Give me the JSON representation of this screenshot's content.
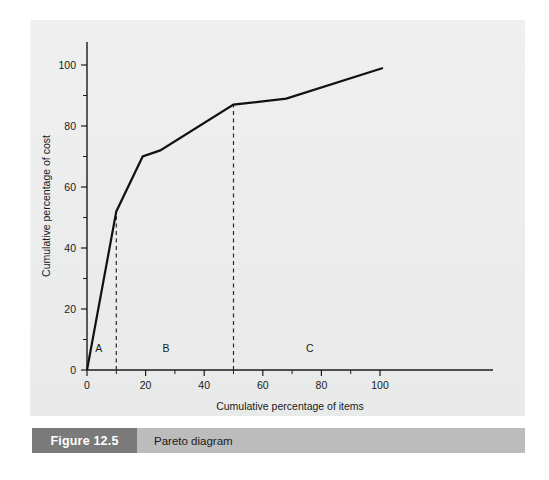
{
  "figure": {
    "number_label": "Figure 12.5",
    "title": "Pareto diagram"
  },
  "chart_data": {
    "type": "line",
    "title": "",
    "xlabel": "Cumulative percentage of items",
    "ylabel": "Cumulative percentage of cost",
    "xlim": [
      0,
      100
    ],
    "ylim": [
      0,
      100
    ],
    "xticks": [
      0,
      20,
      40,
      60,
      80,
      100
    ],
    "yticks": [
      0,
      20,
      40,
      60,
      80,
      100
    ],
    "xtick_labels": [
      "0",
      "20",
      "40",
      "60",
      "80",
      "100"
    ],
    "ytick_labels": [
      "0",
      "20",
      "40",
      "60",
      "80",
      "100"
    ],
    "minor_tick_step": 10,
    "grid": false,
    "legend": null,
    "series": [
      {
        "name": "Cumulative cost curve",
        "x": [
          0,
          10,
          19,
          25,
          50,
          68,
          101
        ],
        "y": [
          0,
          52,
          70,
          72,
          87,
          89,
          99
        ]
      }
    ],
    "annotations": [
      {
        "name": "region-label-a",
        "text": "A",
        "x": 4,
        "y": 6
      },
      {
        "name": "region-label-b",
        "text": "B",
        "x": 27,
        "y": 6
      },
      {
        "name": "region-label-c",
        "text": "C",
        "x": 76,
        "y": 6
      }
    ],
    "dividers": [
      {
        "name": "divider-a-b",
        "x": 10,
        "y_top": 52
      },
      {
        "name": "divider-b-c",
        "x": 50,
        "y_top": 87
      }
    ],
    "colors": {
      "series_line": "#111111",
      "axis": "#1b1b1b",
      "divider": "#2a2a2a",
      "panel_background": "#e9eaea",
      "page_background": "#ffffff",
      "caption_block": "#7a7a7a",
      "caption_bar": "#bcbcbc"
    }
  }
}
